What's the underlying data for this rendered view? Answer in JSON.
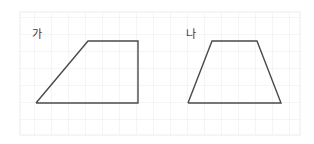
{
  "figure": {
    "background_color": "#ffffff",
    "width": 314,
    "height": 144,
    "grid": {
      "name": "graph-paper-grid",
      "color": "#e9ecef",
      "cell_size": 17,
      "left": 20,
      "top": 12,
      "right": 300,
      "bottom": 135,
      "columns": 17,
      "rows": 7
    },
    "stroke_color": "#4a4a4a",
    "shapes": [
      {
        "id": "shape-ga",
        "label": "가",
        "type": "right-trapezoid",
        "label_x": 32,
        "label_y": 38,
        "points": "36,103 88,41 138,41 138,103 36,103",
        "vertices": [
          {
            "x": 36,
            "y": 103
          },
          {
            "x": 88,
            "y": 41
          },
          {
            "x": 138,
            "y": 41
          },
          {
            "x": 138,
            "y": 103
          }
        ]
      },
      {
        "id": "shape-na",
        "label": "나",
        "type": "isosceles-trapezoid",
        "label_x": 186,
        "label_y": 38,
        "points": "188,103 212,41 257,41 281,103 188,103",
        "vertices": [
          {
            "x": 188,
            "y": 103
          },
          {
            "x": 212,
            "y": 41
          },
          {
            "x": 257,
            "y": 41
          },
          {
            "x": 281,
            "y": 103
          }
        ]
      }
    ]
  }
}
